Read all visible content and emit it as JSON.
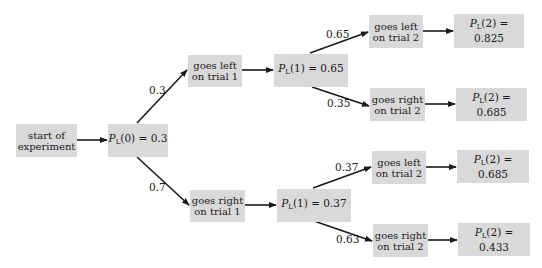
{
  "diagram": {
    "nodes": {
      "start": {
        "line1": "start of",
        "line2": "experiment"
      },
      "p0": {
        "var": "P",
        "sub": "L",
        "arg": "(0)",
        "eq": " = 0.3"
      },
      "left1": {
        "line1": "goes left",
        "line2": "on trial 1"
      },
      "right1": {
        "line1": "goes right",
        "line2": "on trial 1"
      },
      "p1_left": {
        "var": "P",
        "sub": "L",
        "arg": "(1)",
        "eq": " = 0.65"
      },
      "p1_right": {
        "var": "P",
        "sub": "L",
        "arg": "(1)",
        "eq": " = 0.37"
      },
      "ll2": {
        "line1": "goes left",
        "line2": "on trial 2"
      },
      "lr2": {
        "line1": "goes right",
        "line2": "on trial 2"
      },
      "rl2": {
        "line1": "goes left",
        "line2": "on trial 2"
      },
      "rr2": {
        "line1": "goes right",
        "line2": "on trial 2"
      },
      "p2_ll": {
        "var": "P",
        "sub": "L",
        "arg": "(2)",
        "eq": " = 0.825"
      },
      "p2_lr": {
        "var": "P",
        "sub": "L",
        "arg": "(2)",
        "eq": " = 0.685"
      },
      "p2_rl": {
        "var": "P",
        "sub": "L",
        "arg": "(2)",
        "eq": " = 0.685"
      },
      "p2_rr": {
        "var": "P",
        "sub": "L",
        "arg": "(2)",
        "eq": " = 0.433"
      }
    },
    "branch_labels": {
      "p0_left": "0.3",
      "p0_right": "0.7",
      "p1l_left": "0.65",
      "p1l_right": "0.35",
      "p1r_left": "0.37",
      "p1r_right": "0.63"
    },
    "colors": {
      "box_fill": "#d9d9d9",
      "line": "#1a1a1a",
      "background": "#ffffff"
    }
  }
}
